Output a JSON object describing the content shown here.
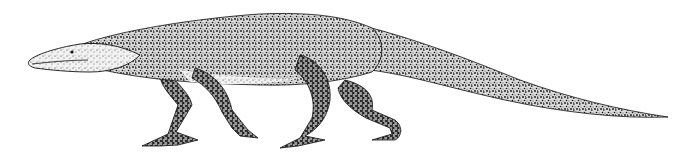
{
  "illustration": {
    "subject": "stippled ink drawing of an extinct quadrupedal reptile walking left",
    "style": "pen-and-ink stippling",
    "background_color": "#ffffff",
    "ink_color": "#111111",
    "parts": [
      "head",
      "neck",
      "body",
      "front-left-leg",
      "front-right-leg",
      "hind-left-leg",
      "hind-right-leg",
      "tail"
    ]
  }
}
